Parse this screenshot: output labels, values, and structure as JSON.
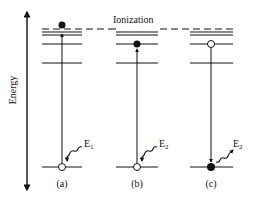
{
  "diagram": {
    "axis_label": "Energy",
    "ionization_label": "Ionization",
    "panels": [
      {
        "id": "a",
        "label": "(a)",
        "energy_label": "E",
        "energy_subscript": "1",
        "process": "photoionization: electron excited from ground to above ionization limit"
      },
      {
        "id": "b",
        "label": "(b)",
        "energy_label": "E",
        "energy_subscript": "2",
        "process": "excitation: electron excited from ground to bound excited level"
      },
      {
        "id": "c",
        "label": "(c)",
        "energy_label": "E",
        "energy_subscript": "2",
        "process": "emission: electron decays from excited level to ground, emitting photon"
      }
    ],
    "colors": {
      "line": "#111111",
      "background": "#ffffff"
    }
  }
}
